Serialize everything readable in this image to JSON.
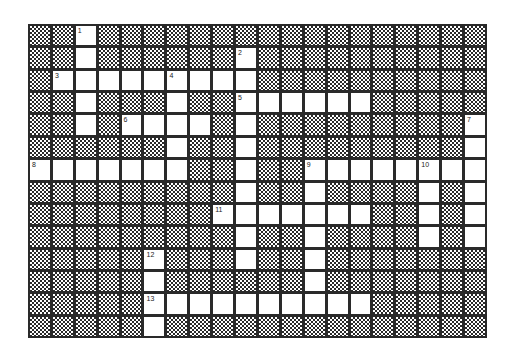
{
  "puzzle": {
    "type": "crossword",
    "cols": 20,
    "rows": 14,
    "colors": {
      "line": "#2a2a2a",
      "open": "#ffffff",
      "block_pattern": "checker"
    },
    "entries": [
      {
        "number": "1",
        "direction": "down",
        "row": 0,
        "col": 2,
        "length": 5
      },
      {
        "number": "2",
        "direction": "down",
        "row": 1,
        "col": 9,
        "length": 10
      },
      {
        "number": "3",
        "direction": "across",
        "row": 2,
        "col": 1,
        "length": 9
      },
      {
        "number": "4",
        "direction": "down",
        "row": 2,
        "col": 6,
        "length": 5
      },
      {
        "number": "5",
        "direction": "across",
        "row": 3,
        "col": 9,
        "length": 6
      },
      {
        "number": "6",
        "direction": "across",
        "row": 4,
        "col": 4,
        "length": 4
      },
      {
        "number": "7",
        "direction": "down",
        "row": 4,
        "col": 19,
        "length": 6
      },
      {
        "number": "8",
        "direction": "across",
        "row": 6,
        "col": 0,
        "length": 7
      },
      {
        "number": "9",
        "direction": "across",
        "row": 6,
        "col": 12,
        "length": 8
      },
      {
        "number": "9",
        "direction": "down",
        "row": 6,
        "col": 12,
        "length": 7
      },
      {
        "number": "10",
        "direction": "down",
        "row": 6,
        "col": 17,
        "length": 4
      },
      {
        "number": "11",
        "direction": "across",
        "row": 8,
        "col": 8,
        "length": 7
      },
      {
        "number": "12",
        "direction": "down",
        "row": 10,
        "col": 5,
        "length": 4
      },
      {
        "number": "13",
        "direction": "across",
        "row": 12,
        "col": 5,
        "length": 10
      }
    ]
  }
}
